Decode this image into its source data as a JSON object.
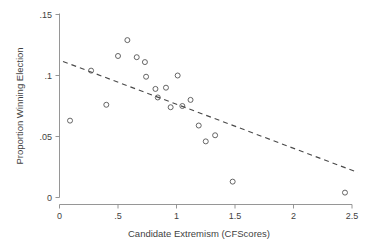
{
  "chart_data": {
    "type": "scatter",
    "title": "",
    "xlabel": "Candidate Extremism (CFScores)",
    "ylabel": "Proportion Winning Election",
    "xlim": [
      0,
      2.5
    ],
    "ylim": [
      0,
      0.15
    ],
    "xticks": [
      0,
      0.5,
      1,
      1.5,
      2,
      2.5
    ],
    "xticklabels": [
      "0",
      ".5",
      "1",
      "1.5",
      "2",
      "2.5"
    ],
    "yticks": [
      0,
      0.05,
      0.1,
      0.15
    ],
    "yticklabels": [
      "0",
      ".05",
      ".1",
      ".15"
    ],
    "grid": false,
    "legend": null,
    "marker": "open-circle",
    "points": [
      {
        "x": 0.09,
        "y": 0.063
      },
      {
        "x": 0.27,
        "y": 0.104
      },
      {
        "x": 0.4,
        "y": 0.076
      },
      {
        "x": 0.5,
        "y": 0.116
      },
      {
        "x": 0.58,
        "y": 0.129
      },
      {
        "x": 0.66,
        "y": 0.115
      },
      {
        "x": 0.73,
        "y": 0.111
      },
      {
        "x": 0.74,
        "y": 0.099
      },
      {
        "x": 0.82,
        "y": 0.089
      },
      {
        "x": 0.84,
        "y": 0.082
      },
      {
        "x": 0.91,
        "y": 0.09
      },
      {
        "x": 0.95,
        "y": 0.074
      },
      {
        "x": 1.01,
        "y": 0.1
      },
      {
        "x": 1.05,
        "y": 0.075
      },
      {
        "x": 1.12,
        "y": 0.08
      },
      {
        "x": 1.19,
        "y": 0.059
      },
      {
        "x": 1.25,
        "y": 0.046
      },
      {
        "x": 1.33,
        "y": 0.051
      },
      {
        "x": 1.48,
        "y": 0.013
      },
      {
        "x": 2.44,
        "y": 0.004
      }
    ],
    "fit_line": {
      "style": "dashed",
      "x_start": 0.03,
      "y_start": 0.1115,
      "x_end": 2.55,
      "y_end": 0.0205
    }
  }
}
